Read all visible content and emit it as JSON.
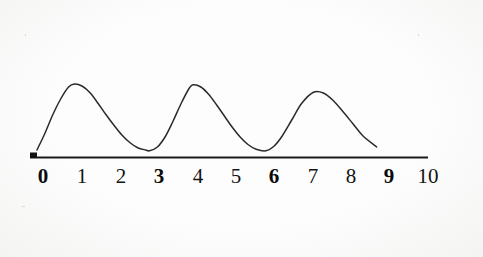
{
  "figure": {
    "background_color": "#fdfdfd",
    "ink_color": "#1a1a1a"
  },
  "axis": {
    "name": "number-line",
    "line_color": "#1a1a1a",
    "origin_marker": "tick",
    "labels": [
      {
        "text": "0",
        "value": 0,
        "bold": true
      },
      {
        "text": "1",
        "value": 1,
        "bold": false
      },
      {
        "text": "2",
        "value": 2,
        "bold": false
      },
      {
        "text": "3",
        "value": 3,
        "bold": true
      },
      {
        "text": "4",
        "value": 4,
        "bold": false
      },
      {
        "text": "5",
        "value": 5,
        "bold": false
      },
      {
        "text": "6",
        "value": 6,
        "bold": true
      },
      {
        "text": "7",
        "value": 7,
        "bold": false
      },
      {
        "text": "8",
        "value": 8,
        "bold": false
      },
      {
        "text": "9",
        "value": 9,
        "bold": true
      },
      {
        "text": "10",
        "value": 10,
        "bold": false
      }
    ]
  },
  "chart_data": {
    "type": "line",
    "title": "",
    "xlabel": "",
    "ylabel": "",
    "xlim": [
      0,
      10
    ],
    "ylim": [
      0,
      1
    ],
    "grid": false,
    "legend": null,
    "period": 3,
    "curve_start_x": 0.1,
    "curve_end_x": 8.7,
    "peaks_x": [
      1.05,
      4.05,
      7.1
    ],
    "troughs_x": [
      2.95,
      5.9
    ],
    "x": [
      0.1,
      0.3,
      0.5,
      0.7,
      0.9,
      1.05,
      1.25,
      1.45,
      1.65,
      1.85,
      2.05,
      2.25,
      2.45,
      2.65,
      2.85,
      2.95,
      3.15,
      3.35,
      3.55,
      3.75,
      3.95,
      4.05,
      4.25,
      4.45,
      4.65,
      4.85,
      5.05,
      5.25,
      5.45,
      5.65,
      5.9,
      6.1,
      6.3,
      6.55,
      6.8,
      7.1,
      7.35,
      7.6,
      7.85,
      8.1,
      8.35,
      8.7
    ],
    "y": [
      0.08,
      0.3,
      0.55,
      0.76,
      0.92,
      0.96,
      0.93,
      0.84,
      0.7,
      0.55,
      0.41,
      0.28,
      0.18,
      0.11,
      0.08,
      0.07,
      0.12,
      0.26,
      0.47,
      0.7,
      0.9,
      0.95,
      0.92,
      0.82,
      0.68,
      0.53,
      0.38,
      0.25,
      0.15,
      0.09,
      0.07,
      0.13,
      0.26,
      0.48,
      0.7,
      0.85,
      0.84,
      0.74,
      0.59,
      0.43,
      0.27,
      0.12
    ],
    "categories": null,
    "values": null
  }
}
